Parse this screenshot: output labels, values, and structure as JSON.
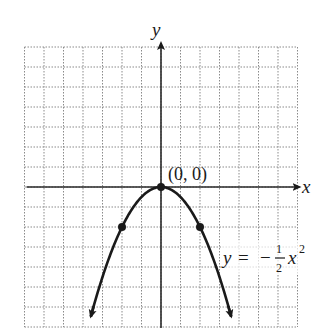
{
  "chart_data": {
    "type": "line",
    "title": "",
    "function_label": "y = -1/2 x^2",
    "equation": {
      "lhs": "y",
      "equals": "=",
      "sign": "−",
      "numerator": "1",
      "denominator": "2",
      "variable": "x",
      "exponent": "2"
    },
    "xlabel": "x",
    "ylabel": "y",
    "xlim": [
      -7,
      7
    ],
    "ylim": [
      -7,
      7
    ],
    "grid": true,
    "grid_style": "dotted",
    "grid_step": 1,
    "vertex_label": "(0, 0)",
    "marked_points": [
      {
        "x": -2,
        "y": -2
      },
      {
        "x": 0,
        "y": 0
      },
      {
        "x": 2,
        "y": -2
      }
    ],
    "series": [
      {
        "name": "y = -1/2 x^2",
        "x": [
          -3.6,
          -3,
          -2,
          -1,
          0,
          1,
          2,
          3,
          3.6
        ],
        "y": [
          -6.48,
          -4.5,
          -2,
          -0.5,
          0,
          -0.5,
          -2,
          -4.5,
          -6.48
        ]
      }
    ],
    "colors": {
      "curve": "#1a1a1a",
      "axes": "#2a2a2a",
      "grid": "#8a8a8a"
    }
  }
}
